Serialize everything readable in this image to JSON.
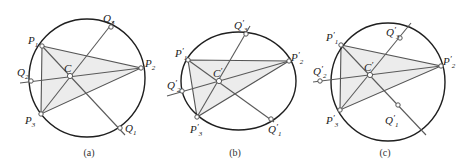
{
  "panels": [
    {
      "id": "a",
      "caption": "(a)",
      "curve": {
        "type": "circle",
        "cx": 87,
        "cy": 78,
        "rx": 58,
        "ry": 59
      },
      "points": {
        "P1": {
          "x": 42,
          "y": 46,
          "name": "P",
          "sub": "1",
          "prime": "",
          "lx": 28,
          "ly": 44
        },
        "P2": {
          "x": 141,
          "y": 68,
          "name": "P",
          "sub": "2",
          "prime": "",
          "lx": 145,
          "ly": 67
        },
        "P3": {
          "x": 41,
          "y": 114,
          "name": "P",
          "sub": "3",
          "prime": "",
          "lx": 25,
          "ly": 124
        },
        "C": {
          "x": 70,
          "y": 76,
          "name": "C",
          "sub": "",
          "prime": "",
          "lx": 64,
          "ly": 72
        },
        "Q1": {
          "x": 120,
          "y": 128,
          "name": "Q",
          "sub": "1",
          "prime": "",
          "lx": 125,
          "ly": 132
        },
        "Q2": {
          "x": 31,
          "y": 81,
          "name": "Q",
          "sub": "2",
          "prime": "",
          "lx": 17,
          "ly": 76
        },
        "Q3": {
          "x": 111,
          "y": 27,
          "name": "Q",
          "sub": "3",
          "prime": "",
          "lx": 103,
          "ly": 22
        }
      },
      "lines": [
        {
          "from": [
            125,
            135
          ],
          "to": [
            42,
            46
          ]
        },
        {
          "from": [
            20,
            83
          ],
          "to": [
            141,
            68
          ]
        },
        {
          "from": [
            41,
            114
          ],
          "to": [
            114,
            21
          ]
        }
      ],
      "caption_pos": {
        "x": 89,
        "y": 156
      }
    },
    {
      "id": "b",
      "caption": "(b)",
      "curve": {
        "type": "ellipse",
        "cx": 238.5,
        "cy": 81,
        "rx": 57.5,
        "ry": 49
      },
      "points": {
        "P1": {
          "x": 188,
          "y": 60,
          "name": "P",
          "sub": "1",
          "prime": "′",
          "lx": 175,
          "ly": 57
        },
        "P2": {
          "x": 289,
          "y": 61,
          "name": "P",
          "sub": "2",
          "prime": "′",
          "lx": 291,
          "ly": 61
        },
        "P3": {
          "x": 197,
          "y": 117,
          "name": "P",
          "sub": "3",
          "prime": "′",
          "lx": 190,
          "ly": 133
        },
        "C": {
          "x": 219,
          "y": 81,
          "name": "C",
          "sub": "",
          "prime": "′",
          "lx": 213,
          "ly": 77
        },
        "Q1": {
          "x": 271,
          "y": 119,
          "name": "Q",
          "sub": "1",
          "prime": "′",
          "lx": 268,
          "ly": 133
        },
        "Q2": {
          "x": 182,
          "y": 91,
          "name": "Q",
          "sub": "2",
          "prime": "′",
          "lx": 167,
          "ly": 89
        },
        "Q3": {
          "x": 246,
          "y": 34,
          "name": "Q",
          "sub": "3",
          "prime": "′",
          "lx": 234,
          "ly": 29
        }
      },
      "lines": [
        {
          "from": [
            274,
            122
          ],
          "to": [
            188,
            60
          ]
        },
        {
          "from": [
            167,
            96
          ],
          "to": [
            289,
            61
          ]
        },
        {
          "from": [
            197,
            117
          ],
          "to": [
            250,
            26
          ]
        }
      ],
      "caption_pos": {
        "x": 235,
        "y": 156
      }
    },
    {
      "id": "c",
      "caption": "(c)",
      "curve": {
        "type": "circle",
        "cx": 388,
        "cy": 82,
        "rx": 57,
        "ry": 59
      },
      "points": {
        "P1": {
          "x": 341,
          "y": 45,
          "name": "P",
          "sub": "1",
          "prime": "′",
          "lx": 326,
          "ly": 41
        },
        "P2": {
          "x": 441,
          "y": 66,
          "name": "P",
          "sub": "2",
          "prime": "′",
          "lx": 443,
          "ly": 65
        },
        "P3": {
          "x": 340,
          "y": 110,
          "name": "P",
          "sub": "3",
          "prime": "′",
          "lx": 326,
          "ly": 124
        },
        "C": {
          "x": 370,
          "y": 75,
          "name": "C",
          "sub": "",
          "prime": "′",
          "lx": 364,
          "ly": 71
        },
        "Q1": {
          "x": 398,
          "y": 105,
          "name": "Q",
          "sub": "1",
          "prime": "′",
          "lx": 385,
          "ly": 124
        },
        "Q2": {
          "x": 320,
          "y": 81,
          "name": "Q",
          "sub": "2",
          "prime": "′",
          "lx": 313,
          "ly": 75
        },
        "Q3": {
          "x": 400,
          "y": 38,
          "name": "Q",
          "sub": "3",
          "prime": "′",
          "lx": 386,
          "ly": 36
        }
      },
      "lines": [
        {
          "from": [
            426,
            135
          ],
          "to": [
            341,
            45
          ]
        },
        {
          "from": [
            313,
            82
          ],
          "to": [
            441,
            66
          ]
        },
        {
          "from": [
            340,
            110
          ],
          "to": [
            411,
            23
          ]
        }
      ],
      "caption_pos": {
        "x": 385,
        "y": 156
      }
    }
  ],
  "style": {
    "curve_color": "#1f1f1f",
    "line_color": "#5a5a5a",
    "triangle_fill": "#ececec"
  }
}
